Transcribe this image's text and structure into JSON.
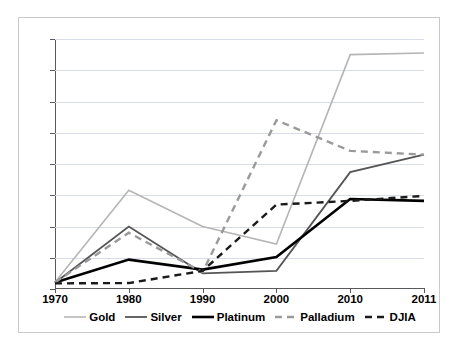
{
  "chart_data": {
    "type": "line",
    "title": "",
    "xlabel": "",
    "ylabel": "",
    "categories": [
      "1970",
      "1980",
      "1990",
      "2000",
      "2010",
      "2011"
    ],
    "x": [
      1970,
      1980,
      1990,
      2000,
      2010,
      2011
    ],
    "ylim": [
      0,
      4000
    ],
    "ytick_labels": [
      "0",
      "500",
      "1000",
      "1500",
      "2000",
      "2500",
      "3000",
      "3500",
      "4000"
    ],
    "ytick_values": [
      0,
      500,
      1000,
      1500,
      2000,
      2500,
      3000,
      3500,
      4000
    ],
    "grid": true,
    "legend_position": "bottom",
    "series": [
      {
        "name": "Gold",
        "values": [
          110,
          1580,
          1000,
          720,
          3750,
          3775
        ],
        "color": "#b5b5b5",
        "style": "solid",
        "width": 1.6
      },
      {
        "name": "Silver",
        "values": [
          100,
          1000,
          250,
          290,
          1870,
          2150
        ],
        "color": "#555555",
        "style": "solid",
        "width": 1.8
      },
      {
        "name": "Platinum",
        "values": [
          105,
          470,
          310,
          510,
          1440,
          1410
        ],
        "color": "#000000",
        "style": "solid",
        "width": 2.6
      },
      {
        "name": "Palladium",
        "values": [
          105,
          900,
          270,
          2700,
          2210,
          2150
        ],
        "color": "#9a9a9a",
        "style": "dashed",
        "width": 2.4
      },
      {
        "name": "DJIA",
        "values": [
          90,
          95,
          290,
          1350,
          1410,
          1490
        ],
        "color": "#1a1a1a",
        "style": "dashed",
        "width": 2.4
      }
    ]
  },
  "legend": {
    "items": [
      {
        "label": "Gold"
      },
      {
        "label": "Silver"
      },
      {
        "label": "Platinum"
      },
      {
        "label": "Palladium"
      },
      {
        "label": "DJIA"
      }
    ]
  }
}
